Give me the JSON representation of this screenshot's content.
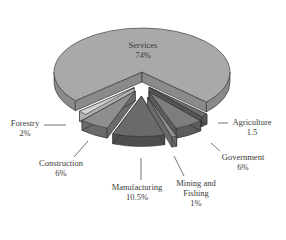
{
  "chart_data": {
    "type": "pie",
    "style": "3d-exploded",
    "title": "",
    "slices": [
      {
        "label": "Services",
        "value": 74,
        "display": "74%",
        "color": "#a9a9a9",
        "side": "#8a8a8a"
      },
      {
        "label": "Agriculture",
        "value": 1.5,
        "display": "1.5",
        "color": "#6e6e6e",
        "side": "#555555"
      },
      {
        "label": "Government",
        "value": 6,
        "display": "6%",
        "color": "#7d7d7d",
        "side": "#5c5c5c"
      },
      {
        "label": "Mining and Fishing",
        "value": 1,
        "display": "1%",
        "color": "#909090",
        "side": "#6a6a6a"
      },
      {
        "label": "Manufacturing",
        "value": 10.5,
        "display": "10.5%",
        "color": "#6a6a6a",
        "side": "#4e4e4e"
      },
      {
        "label": "Construction",
        "value": 6,
        "display": "6%",
        "color": "#8e8e8e",
        "side": "#6b6b6b"
      },
      {
        "label": "Forestry",
        "value": 2,
        "display": "2%",
        "color": "#d2d2d2",
        "side": "#b0b0b0"
      }
    ]
  },
  "labels": {
    "services": {
      "name": "Services",
      "value": "74%"
    },
    "agriculture": {
      "name": "Agriculture",
      "value": "1.5"
    },
    "government": {
      "name": "Government",
      "value": "6%"
    },
    "mining": {
      "name1": "Mining and",
      "name2": "Fishing",
      "value": "1%"
    },
    "manufacturing": {
      "name": "Manufacturing",
      "value": "10.5%"
    },
    "construction": {
      "name": "Construction",
      "value": "6%"
    },
    "forestry": {
      "name": "Forestry",
      "value": "2%"
    }
  }
}
